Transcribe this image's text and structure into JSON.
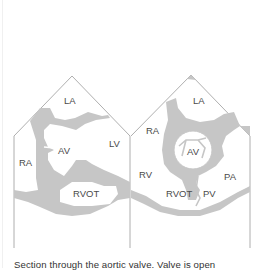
{
  "colors": {
    "tissue": "#c6c6c6",
    "outline": "#9a9a9a",
    "label": "#4a4a4a",
    "background": "#ffffff"
  },
  "panels": [
    {
      "id": "long-axis",
      "labels": {
        "la": "LA",
        "lv": "LV",
        "ra": "RA",
        "av": "AV",
        "rvot": "RVOT"
      }
    },
    {
      "id": "short-axis",
      "labels": {
        "la": "LA",
        "ra": "RA",
        "av": "AV",
        "rv": "RV",
        "pa": "PA",
        "rvot": "RVOT",
        "pv": "PV"
      }
    }
  ],
  "caption": "Section through the aortic valve. Valve is open"
}
